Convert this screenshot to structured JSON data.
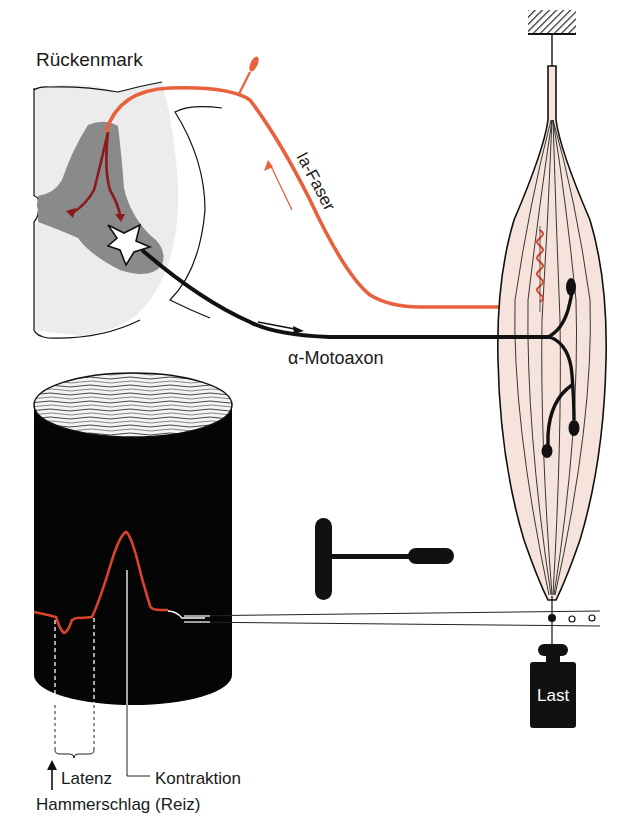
{
  "diagram": {
    "labels": {
      "spinal_cord": "Rückenmark",
      "ia_fiber": "Ia-Faser",
      "alpha_motoaxon": "α-Motoaxon",
      "latency": "Latenz",
      "contraction": "Kontraktion",
      "hammer_stimulus": "Hammerschlag (Reiz)",
      "load": "Last"
    },
    "colors": {
      "ia_fiber": "#e8603c",
      "ia_collateral": "#8b1a1a",
      "gray_matter": "#8a8a8a",
      "white_matter": "#ececec",
      "muscle": "#f6e3dc",
      "motoaxon": "#111111",
      "drum": "#050505",
      "trace": "#d9442b"
    },
    "components": [
      "spinal-cord-cross-section",
      "ia-afferent-fiber",
      "alpha-motoneuron",
      "muscle-with-spindle",
      "kymograph-drum",
      "reflex-hammer",
      "lever-writer",
      "weight-load"
    ]
  }
}
